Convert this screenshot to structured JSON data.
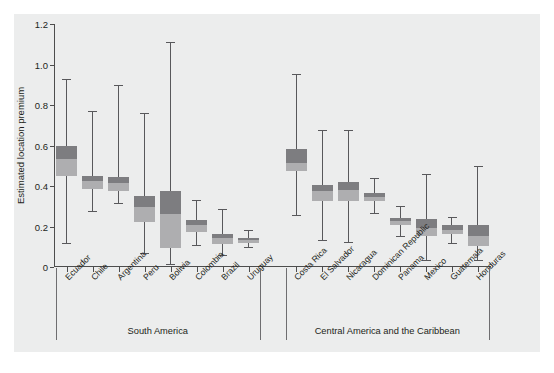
{
  "chart_data": {
    "type": "box",
    "title": "",
    "xlabel": "",
    "ylabel": "Estimated location premium",
    "ylim": [
      0,
      1.2
    ],
    "ytick_labels": [
      "0",
      "0.2",
      "0.4",
      "0.6",
      "0.8",
      "1.0",
      "1.2"
    ],
    "ytick_values": [
      0,
      0.2,
      0.4,
      0.6,
      0.8,
      1.0,
      1.2
    ],
    "grid": false,
    "legend": "none",
    "categories": [
      "Ecuador",
      "Chile",
      "Argentina",
      "Peru",
      "Bolivia",
      "Colombia",
      "Brazil",
      "Uruguay",
      "Costa Rica",
      "El Salvador",
      "Nicaragua",
      "Dominican Republic",
      "Panama",
      "Mexico",
      "Guatemala",
      "Honduras"
    ],
    "boxes": [
      {
        "category": "Ecuador",
        "whisker_low": 0.12,
        "q1": 0.45,
        "median": 0.535,
        "q3": 0.6,
        "whisker_high": 0.93
      },
      {
        "category": "Chile",
        "whisker_low": 0.275,
        "q1": 0.385,
        "median": 0.425,
        "q3": 0.45,
        "whisker_high": 0.77
      },
      {
        "category": "Argentina",
        "whisker_low": 0.315,
        "q1": 0.375,
        "median": 0.415,
        "q3": 0.445,
        "whisker_high": 0.9
      },
      {
        "category": "Peru",
        "whisker_low": 0.07,
        "q1": 0.22,
        "median": 0.295,
        "q3": 0.35,
        "whisker_high": 0.76
      },
      {
        "category": "Bolivia",
        "whisker_low": 0.015,
        "q1": 0.095,
        "median": 0.26,
        "q3": 0.375,
        "whisker_high": 1.11
      },
      {
        "category": "Colombia",
        "whisker_low": 0.11,
        "q1": 0.175,
        "median": 0.205,
        "q3": 0.23,
        "whisker_high": 0.33
      },
      {
        "category": "Brazil",
        "whisker_low": 0.06,
        "q1": 0.115,
        "median": 0.145,
        "q3": 0.165,
        "whisker_high": 0.285
      },
      {
        "category": "Uruguay",
        "whisker_low": 0.1,
        "q1": 0.12,
        "median": 0.132,
        "q3": 0.145,
        "whisker_high": 0.185
      },
      {
        "category": "Costa Rica",
        "whisker_low": 0.255,
        "q1": 0.475,
        "median": 0.515,
        "q3": 0.585,
        "whisker_high": 0.955
      },
      {
        "category": "El Salvador",
        "whisker_low": 0.135,
        "q1": 0.325,
        "median": 0.375,
        "q3": 0.405,
        "whisker_high": 0.675
      },
      {
        "category": "Nicaragua",
        "whisker_low": 0.125,
        "q1": 0.325,
        "median": 0.38,
        "q3": 0.42,
        "whisker_high": 0.675
      },
      {
        "category": "Dominican Republic",
        "whisker_low": 0.265,
        "q1": 0.325,
        "median": 0.345,
        "q3": 0.365,
        "whisker_high": 0.44
      },
      {
        "category": "Panama",
        "whisker_low": 0.155,
        "q1": 0.205,
        "median": 0.225,
        "q3": 0.24,
        "whisker_high": 0.3
      },
      {
        "category": "Mexico",
        "whisker_low": 0.035,
        "q1": 0.155,
        "median": 0.195,
        "q3": 0.235,
        "whisker_high": 0.46
      },
      {
        "category": "Guatemala",
        "whisker_low": 0.12,
        "q1": 0.165,
        "median": 0.185,
        "q3": 0.205,
        "whisker_high": 0.245
      },
      {
        "category": "Honduras",
        "whisker_low": 0.035,
        "q1": 0.105,
        "median": 0.155,
        "q3": 0.205,
        "whisker_high": 0.5
      }
    ],
    "groups": [
      {
        "label": "South America",
        "start_index": 0,
        "end_index": 7
      },
      {
        "label": "Central America and the Caribbean",
        "start_index": 8,
        "end_index": 15
      }
    ],
    "colors": {
      "box_upper": "#7d7d80",
      "box_lower": "#aeaeb0",
      "whisker": "#58585b",
      "axis": "#4d4d4d",
      "panel_background": "#eceded",
      "text": "#231f20"
    }
  }
}
